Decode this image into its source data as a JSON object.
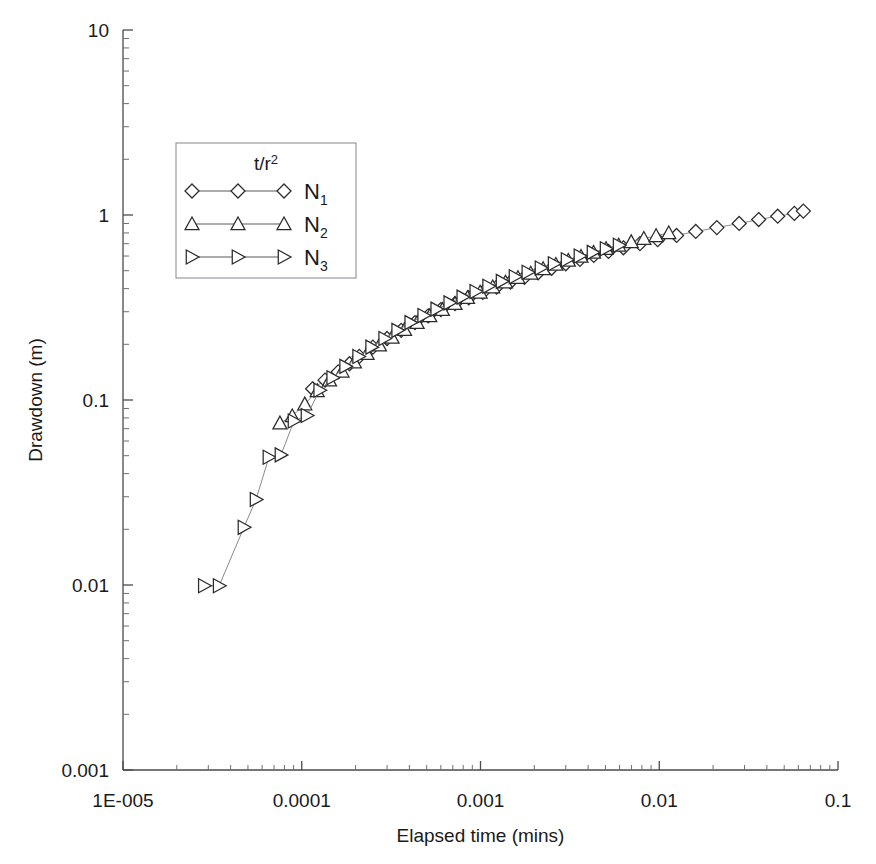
{
  "chart_data": {
    "type": "scatter",
    "title": "",
    "xlabel": "Elapsed time (mins)",
    "ylabel": "Drawdown (m)",
    "xscale": "log",
    "yscale": "log",
    "xlim": [
      1e-05,
      0.1
    ],
    "ylim": [
      0.001,
      10
    ],
    "grid": false,
    "legend_position": "upper-left-inside",
    "legend_title": "t/r2",
    "legend_title_display": "t/r²",
    "xtick_labels": [
      "1E-005",
      "0.0001",
      "0.001",
      "0.01",
      "0.1"
    ],
    "xtick_values": [
      1e-05,
      0.0001,
      0.001,
      0.01,
      0.1
    ],
    "ytick_labels": [
      "10",
      "1",
      "0.1",
      "0.01",
      "0.001"
    ],
    "ytick_values": [
      10,
      1,
      0.1,
      0.01,
      0.001
    ],
    "series": [
      {
        "name": "N1",
        "name_display": "N",
        "subscript": "1",
        "marker": "diamond",
        "x": [
          0.000115,
          0.000135,
          0.00016,
          0.000185,
          0.00021,
          0.00025,
          0.0003,
          0.00036,
          0.00043,
          0.00051,
          0.0006,
          0.00072,
          0.00086,
          0.00103,
          0.00123,
          0.00147,
          0.00176,
          0.0021,
          0.0025,
          0.003,
          0.0036,
          0.0043,
          0.0052,
          0.0063,
          0.0078,
          0.0098,
          0.0125,
          0.016,
          0.021,
          0.028,
          0.036,
          0.046,
          0.057,
          0.064
        ],
        "y": [
          0.115,
          0.128,
          0.142,
          0.157,
          0.172,
          0.193,
          0.215,
          0.238,
          0.262,
          0.285,
          0.308,
          0.332,
          0.357,
          0.382,
          0.408,
          0.434,
          0.46,
          0.487,
          0.515,
          0.545,
          0.575,
          0.605,
          0.635,
          0.665,
          0.7,
          0.735,
          0.775,
          0.815,
          0.855,
          0.9,
          0.945,
          0.985,
          1.02,
          1.05
        ]
      },
      {
        "name": "N2",
        "name_display": "N",
        "subscript": "2",
        "marker": "triangle-up",
        "x": [
          7.55e-05,
          8.85e-05,
          0.000104,
          0.000122,
          0.000143,
          0.000168,
          0.000197,
          0.000232,
          0.000272,
          0.00032,
          0.000376,
          0.000442,
          0.00052,
          0.000612,
          0.00072,
          0.000846,
          0.000995,
          0.00117,
          0.00138,
          0.00162,
          0.00191,
          0.00224,
          0.00264,
          0.0031,
          0.00365,
          0.00429,
          0.00504,
          0.00593,
          0.00697,
          0.0082,
          0.0096,
          0.0113
        ],
        "y": [
          0.075,
          0.082,
          0.095,
          0.112,
          0.128,
          0.143,
          0.16,
          0.178,
          0.198,
          0.218,
          0.24,
          0.262,
          0.285,
          0.308,
          0.332,
          0.357,
          0.382,
          0.408,
          0.433,
          0.458,
          0.484,
          0.512,
          0.54,
          0.568,
          0.597,
          0.627,
          0.657,
          0.686,
          0.716,
          0.746,
          0.772,
          0.8
        ]
      },
      {
        "name": "N3",
        "name_display": "N",
        "subscript": "3",
        "marker": "triangle-right",
        "x": [
          2.85e-05,
          3.45e-05,
          4.75e-05,
          5.55e-05,
          6.55e-05,
          7.65e-05,
          9.05e-05,
          0.000107,
          0.000126,
          0.000149,
          0.000176,
          0.000208,
          0.000246,
          0.000291,
          0.000344,
          0.000407,
          0.000481,
          0.000569,
          0.000673,
          0.000796,
          0.000941,
          0.00111,
          0.00132,
          0.00156,
          0.00184,
          0.00218,
          0.00258,
          0.00305,
          0.0036,
          0.00426,
          0.00504,
          0.00596
        ],
        "y": [
          0.0099,
          0.0099,
          0.0205,
          0.029,
          0.049,
          0.0505,
          0.077,
          0.0825,
          0.113,
          0.132,
          0.152,
          0.172,
          0.193,
          0.215,
          0.238,
          0.262,
          0.286,
          0.31,
          0.335,
          0.36,
          0.386,
          0.412,
          0.438,
          0.464,
          0.49,
          0.517,
          0.545,
          0.573,
          0.6,
          0.628,
          0.657,
          0.686
        ]
      }
    ]
  },
  "colors": {
    "axis": "#4a4a4a",
    "marker_stroke": "#2b2b2b",
    "marker_fill": "#ffffff",
    "series_line": "#8a8a8a",
    "legend_border": "#8f8f99",
    "background": "#ffffff"
  }
}
